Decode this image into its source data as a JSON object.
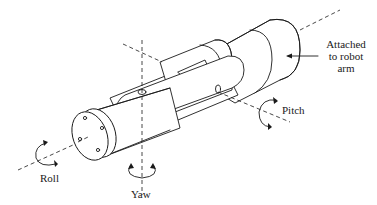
{
  "figure": {
    "type": "line-drawing",
    "stroke_color": "#1a1a1a",
    "background": "#ffffff"
  },
  "labels": {
    "attached": {
      "line1": "Attached",
      "line2": "to robot",
      "line3": "arm"
    },
    "pitch": "Pitch",
    "roll": "Roll",
    "yaw": "Yaw"
  },
  "icons": {
    "roll_rotation": "circular-arrow-icon",
    "pitch_rotation": "circular-arrow-icon",
    "yaw_rotation": "circular-arrow-icon",
    "attach_arrow": "arrow-left-icon"
  }
}
